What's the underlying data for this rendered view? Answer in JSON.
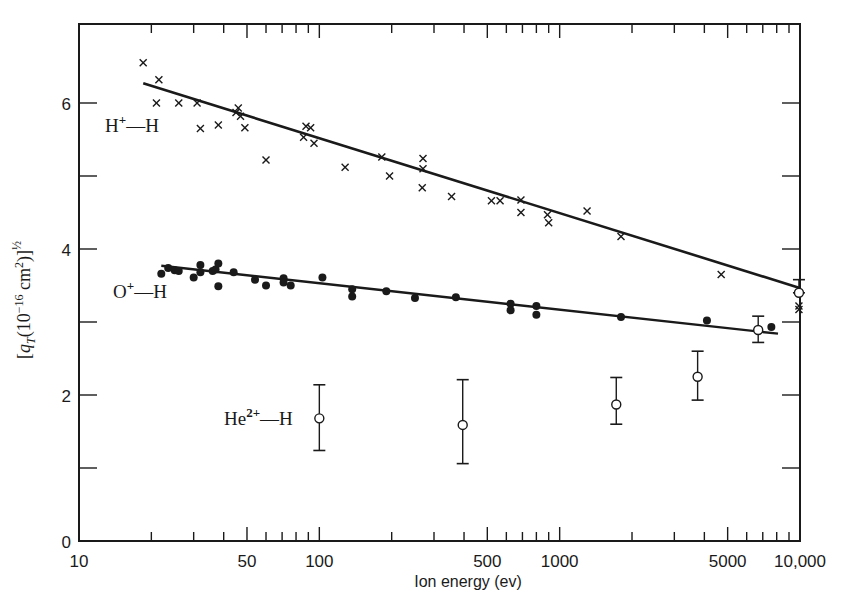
{
  "chart_data": {
    "type": "scatter",
    "title": "",
    "xlabel": "Ion energy (ev)",
    "ylabel": "[q_T(10^-16 cm^2)]^1/2",
    "xscale": "log",
    "xlim": [
      10,
      10000
    ],
    "ylim": [
      0,
      7.1
    ],
    "x_ticks_major": [
      10,
      50,
      100,
      500,
      1000,
      5000,
      10000
    ],
    "x_tick_labels": [
      "10",
      "50",
      "100",
      "500",
      "1000",
      "5000",
      "10,000"
    ],
    "y_ticks": [
      0,
      2,
      4,
      6
    ],
    "y_tick_labels": [
      "0",
      "2",
      "4",
      "6"
    ],
    "y_minor_ticks": [
      1,
      3,
      5
    ],
    "grid": false,
    "legend": "inline labels",
    "series": [
      {
        "name": "H+—H",
        "label_main": "H",
        "label_sup": "+",
        "label_rest": "—H",
        "marker": "x",
        "points": [
          [
            18.5,
            6.55
          ],
          [
            21.5,
            6.32
          ],
          [
            21,
            6.0
          ],
          [
            26,
            6.0
          ],
          [
            31,
            6.0
          ],
          [
            32,
            5.65
          ],
          [
            38,
            5.7
          ],
          [
            45,
            5.87
          ],
          [
            46,
            5.93
          ],
          [
            47,
            5.82
          ],
          [
            49,
            5.66
          ],
          [
            60,
            5.22
          ],
          [
            88,
            5.68
          ],
          [
            92,
            5.66
          ],
          [
            86,
            5.53
          ],
          [
            95,
            5.45
          ],
          [
            128,
            5.12
          ],
          [
            182,
            5.26
          ],
          [
            196,
            5.0
          ],
          [
            270,
            5.24
          ],
          [
            270,
            5.1
          ],
          [
            268,
            4.84
          ],
          [
            355,
            4.72
          ],
          [
            520,
            4.66
          ],
          [
            565,
            4.66
          ],
          [
            690,
            4.67
          ],
          [
            690,
            4.5
          ],
          [
            890,
            4.47
          ],
          [
            900,
            4.36
          ],
          [
            1300,
            4.52
          ],
          [
            1800,
            4.17
          ],
          [
            4700,
            3.65
          ],
          [
            9900,
            3.17
          ],
          [
            9900,
            3.22
          ]
        ],
        "fit_line": [
          [
            18.5,
            6.27
          ],
          [
            9900,
            3.47
          ]
        ]
      },
      {
        "name": "O+—H",
        "label_main": "O",
        "label_sup": "+",
        "label_rest": "—H",
        "marker": "filled-circle",
        "points": [
          [
            22,
            3.66
          ],
          [
            23.5,
            3.74
          ],
          [
            25,
            3.71
          ],
          [
            26,
            3.7
          ],
          [
            30,
            3.61
          ],
          [
            32,
            3.78
          ],
          [
            32,
            3.68
          ],
          [
            36,
            3.7
          ],
          [
            37,
            3.72
          ],
          [
            38,
            3.8
          ],
          [
            38,
            3.49
          ],
          [
            44,
            3.68
          ],
          [
            54,
            3.58
          ],
          [
            60,
            3.5
          ],
          [
            71,
            3.6
          ],
          [
            71,
            3.54
          ],
          [
            76,
            3.5
          ],
          [
            103,
            3.61
          ],
          [
            137,
            3.45
          ],
          [
            137,
            3.35
          ],
          [
            190,
            3.42
          ],
          [
            250,
            3.33
          ],
          [
            370,
            3.34
          ],
          [
            625,
            3.25
          ],
          [
            625,
            3.16
          ],
          [
            800,
            3.22
          ],
          [
            800,
            3.1
          ],
          [
            1800,
            3.07
          ],
          [
            4100,
            3.02
          ],
          [
            7600,
            2.93
          ]
        ],
        "fit_line": [
          [
            22,
            3.77
          ],
          [
            8100,
            2.84
          ]
        ]
      },
      {
        "name": "He2+—H",
        "label_main": "He",
        "label_sup": "2+",
        "label_rest": "—H",
        "marker": "open-circle-errorbar",
        "points": [
          {
            "x": 100,
            "y": 1.68,
            "err_low": 1.24,
            "err_high": 2.14
          },
          {
            "x": 395,
            "y": 1.59,
            "err_low": 1.06,
            "err_high": 2.21
          },
          {
            "x": 1720,
            "y": 1.87,
            "err_low": 1.6,
            "err_high": 2.24
          },
          {
            "x": 3750,
            "y": 2.25,
            "err_low": 1.93,
            "err_high": 2.6
          },
          {
            "x": 6700,
            "y": 2.89,
            "err_low": 2.72,
            "err_high": 3.08
          },
          {
            "x": 9900,
            "y": 3.4,
            "err_low": 3.4,
            "err_high": 3.58
          }
        ]
      }
    ]
  }
}
